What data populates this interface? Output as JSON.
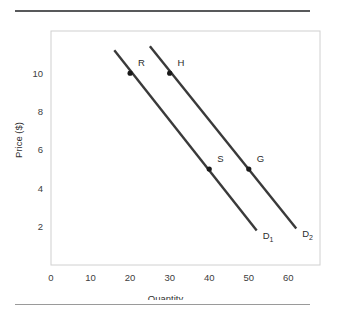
{
  "chart_data": {
    "type": "line",
    "title": "",
    "xlabel": "Quantity",
    "ylabel": "Price ($)",
    "xlim": [
      0,
      68
    ],
    "ylim": [
      0,
      12.2
    ],
    "xticks": [
      "0",
      "10",
      "20",
      "30",
      "40",
      "50",
      "60"
    ],
    "xtick_values": [
      0,
      10,
      20,
      30,
      40,
      50,
      60
    ],
    "yticks": [
      "2",
      "4",
      "6",
      "8",
      "10"
    ],
    "ytick_values": [
      2,
      4,
      6,
      8,
      10
    ],
    "grid": false,
    "legend": "none",
    "line_color": "#3a3a3a",
    "frame_color": "#d0d0d0",
    "background": "#ffffff",
    "series": [
      {
        "name": "D1",
        "label": "D",
        "subscript": "1",
        "label_x": 53.5,
        "label_y": 1.35,
        "x": [
          16.0,
          52.0
        ],
        "y": [
          11.2,
          1.8
        ],
        "points": [
          {
            "name": "R",
            "x": 20,
            "y": 10,
            "label_dx": 2.0,
            "label_dy": 0.35
          },
          {
            "name": "S",
            "x": 40,
            "y": 5,
            "label_dx": 2.0,
            "label_dy": 0.35
          }
        ]
      },
      {
        "name": "D2",
        "label": "D",
        "subscript": "2",
        "label_x": 63.5,
        "label_y": 1.45,
        "x": [
          25.0,
          62.0
        ],
        "y": [
          11.4,
          1.9
        ],
        "points": [
          {
            "name": "H",
            "x": 30,
            "y": 10,
            "label_dx": 2.0,
            "label_dy": 0.35
          },
          {
            "name": "G",
            "x": 50,
            "y": 5,
            "label_dx": 2.0,
            "label_dy": 0.35
          }
        ]
      }
    ]
  },
  "axes": {
    "x_label": "Quantity",
    "y_label": "Price ($)",
    "x_tick_labels": [
      "0",
      "10",
      "20",
      "30",
      "40",
      "50",
      "60"
    ],
    "y_tick_labels": [
      "2",
      "4",
      "6",
      "8",
      "10"
    ]
  },
  "annotations": {
    "point_labels": [
      "R",
      "H",
      "S",
      "G"
    ],
    "curve_labels": [
      "D1",
      "D2"
    ]
  }
}
